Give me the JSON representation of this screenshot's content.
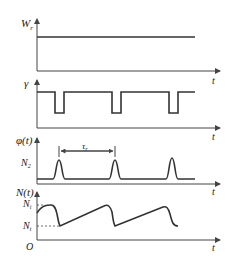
{
  "diagram": {
    "panels": [
      {
        "id": "wp",
        "ylabel_main": "W",
        "ylabel_sub": "r",
        "xlabel": "t",
        "description": "constant pump rate"
      },
      {
        "id": "gamma",
        "ylabel_main": "γ",
        "xlabel": "t",
        "description": "loss modulation with periodic dips"
      },
      {
        "id": "phi",
        "ylabel_main": "φ(t)",
        "xlabel": "t",
        "level_label_main": "N",
        "level_label_sub": "2",
        "period_label_main": "τ",
        "period_label_sub": "r",
        "description": "periodic output pulses"
      },
      {
        "id": "n",
        "ylabel_main": "N(t)",
        "xlabel": "t",
        "origin_label": "O",
        "upper_label_main": "N",
        "upper_label_sub": "i",
        "lower_label_main": "N",
        "lower_label_sub": "t",
        "description": "population inversion sawtooth"
      }
    ]
  }
}
